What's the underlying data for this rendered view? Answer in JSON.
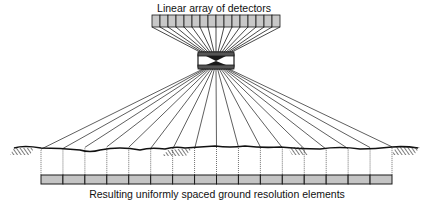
{
  "diagram": {
    "title": "Linear array of detectors",
    "caption": "Resulting uniformly spaced ground resolution elements",
    "detector_count": 16,
    "ground_element_count": 16,
    "colors": {
      "detector_fill": "#c8c8c8",
      "ground_bar_fill": "#c4c4c4",
      "line": "#1a1a1a"
    },
    "components": [
      {
        "id": "detector-array",
        "label": "Linear array of detectors"
      },
      {
        "id": "lens",
        "label": "Lens"
      },
      {
        "id": "ground-surface",
        "label": "Ground surface"
      },
      {
        "id": "ground-resolution-elements",
        "label": "Resulting uniformly spaced ground resolution elements"
      }
    ]
  }
}
